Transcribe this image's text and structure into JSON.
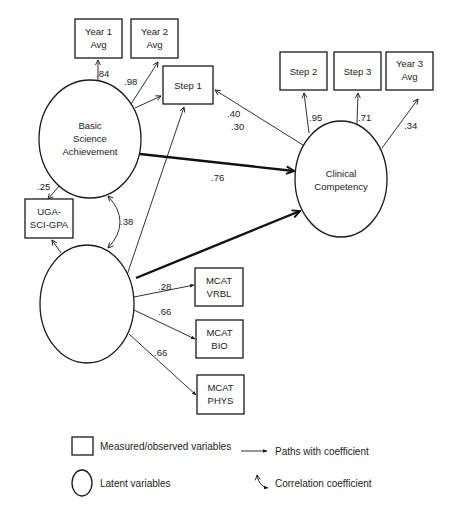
{
  "diagram": {
    "type": "structural-equation-model",
    "latent_variables": [
      {
        "id": "bsa",
        "lines": [
          "Basic",
          "Science",
          "Achievement"
        ]
      },
      {
        "id": "cc",
        "lines": [
          "Clinical",
          "Competency"
        ]
      },
      {
        "id": "ams",
        "lines": [
          "Aptitude for",
          "Medical School"
        ]
      }
    ],
    "measured_variables": [
      {
        "id": "y1",
        "lines": [
          "Year 1",
          "Avg"
        ]
      },
      {
        "id": "y2",
        "lines": [
          "Year 2",
          "Avg"
        ]
      },
      {
        "id": "s1",
        "lines": [
          "Step 1"
        ]
      },
      {
        "id": "s2",
        "lines": [
          "Step 2"
        ]
      },
      {
        "id": "s3",
        "lines": [
          "Step 3"
        ]
      },
      {
        "id": "y3",
        "lines": [
          "Year 3",
          "Avg"
        ]
      },
      {
        "id": "uga",
        "lines": [
          "UGA-",
          "SCI-GPA"
        ]
      },
      {
        "id": "mv",
        "lines": [
          "MCAT",
          "VRBL"
        ]
      },
      {
        "id": "mb",
        "lines": [
          "MCAT",
          "BIO"
        ]
      },
      {
        "id": "mp",
        "lines": [
          "MCAT",
          "PHYS"
        ]
      }
    ],
    "paths": [
      {
        "from": "bsa",
        "to": "y1",
        "coef": ".84"
      },
      {
        "from": "bsa",
        "to": "y2",
        "coef": ".98"
      },
      {
        "from": "bsa",
        "to": "s1",
        "coef": ""
      },
      {
        "from": "cc",
        "to": "s1",
        "coef": ".40 / .30"
      },
      {
        "from": "cc",
        "to": "s2",
        "coef": ".95"
      },
      {
        "from": "cc",
        "to": "s3",
        "coef": ".71"
      },
      {
        "from": "cc",
        "to": "y3",
        "coef": ".34"
      },
      {
        "from": "bsa",
        "to": "cc",
        "coef": ".76",
        "emphasis": "thick"
      },
      {
        "from": "ams",
        "to": "cc",
        "coef": ".45",
        "emphasis": "thick"
      },
      {
        "from": "ams",
        "to": "s1",
        "coef": ".31"
      },
      {
        "from": "bsa",
        "to": "uga",
        "coef": ".25"
      },
      {
        "from": "ams",
        "to": "uga",
        "coef": ".22"
      },
      {
        "from": "ams",
        "to": "mv",
        "coef": ".28"
      },
      {
        "from": "ams",
        "to": "mb",
        "coef": ".66"
      },
      {
        "from": "ams",
        "to": "mp",
        "coef": ".66"
      }
    ],
    "correlations": [
      {
        "between": [
          "bsa",
          "ams"
        ],
        "coef": ".38"
      }
    ],
    "coefficients": {
      "y1": ".84",
      "y2": ".98",
      "s1a": ".40",
      "s1b": ".30",
      "s2": ".95",
      "s3": ".71",
      "y3": ".34",
      "bsa_cc": ".76",
      "ams_cc": ".45",
      "ams_s1": ".31",
      "bsa_uga": ".25",
      "ams_uga": ".22",
      "corr": ".38",
      "mv": ".28",
      "mb": ".66",
      "mp": ".66"
    },
    "labels": {
      "y1_l1": "Year 1",
      "y1_l2": "Avg",
      "y2_l1": "Year 2",
      "y2_l2": "Avg",
      "s1": "Step 1",
      "s2": "Step 2",
      "s3": "Step 3",
      "y3_l1": "Year 3",
      "y3_l2": "Avg",
      "uga_l1": "UGA-",
      "uga_l2": "SCI-GPA",
      "mv_l1": "MCAT",
      "mv_l2": "VRBL",
      "mb_l1": "MCAT",
      "mb_l2": "BIO",
      "mp_l1": "MCAT",
      "mp_l2": "PHYS",
      "bsa_l1": "Basic",
      "bsa_l2": "Science",
      "bsa_l3": "Achievement",
      "cc_l1": "Clinical",
      "cc_l2": "Competency",
      "ams_l1": "Aptitude for",
      "ams_l2": "Medical School"
    }
  },
  "legend": {
    "measured": "Measured/observed variables",
    "latent": "Latent variables",
    "paths": "Paths with coefficient",
    "correlation": "Correlation coefficient"
  }
}
